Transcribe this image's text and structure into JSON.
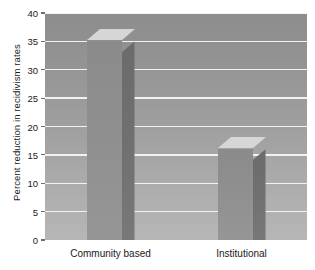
{
  "chart_data": {
    "type": "bar",
    "title": "",
    "subtitle": "",
    "xlabel": "",
    "ylabel": "Percent reduction in recidivism rates",
    "categories": [
      "Community based",
      "Institutional"
    ],
    "values": [
      35,
      16
    ],
    "series": [
      {
        "name": "Percent reduction in recidivism rates",
        "values": [
          35,
          16
        ]
      }
    ],
    "ylim": [
      0,
      40
    ],
    "yticks": [
      0,
      5,
      10,
      15,
      20,
      25,
      30,
      35,
      40
    ],
    "ytick_labels": [
      "0",
      "5",
      "10",
      "15",
      "20",
      "25",
      "30",
      "35",
      "40"
    ],
    "grid": "horizontal",
    "legend": "none",
    "style_3d": true,
    "annotations": []
  },
  "colors": {
    "bar_front": "#8f8f8f",
    "bar_side": "#707070",
    "bar_top": "#d6d6d6",
    "gridline": "#f2f2f2",
    "plot_background_top": "#8d8d8d",
    "plot_background_bottom": "#b6b6b6",
    "text": "#1a1a1a",
    "page_background": "#ffffff"
  }
}
